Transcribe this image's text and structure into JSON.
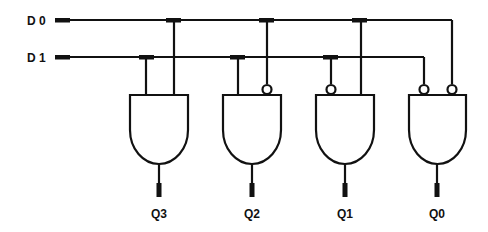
{
  "diagram": {
    "inputs": [
      {
        "label": "D 0",
        "y": 20
      },
      {
        "label": "D 1",
        "y": 57
      }
    ],
    "outputs": [
      {
        "label": "Q3",
        "x": 159
      },
      {
        "label": "Q2",
        "x": 252
      },
      {
        "label": "Q1",
        "x": 345
      },
      {
        "label": "Q0",
        "x": 437
      }
    ],
    "gates": [
      {
        "name": "and-gate-q3",
        "inputs": [
          "D1",
          "D0"
        ],
        "inverted": [
          false,
          false
        ]
      },
      {
        "name": "and-gate-q2",
        "inputs": [
          "D1",
          "D0"
        ],
        "inverted": [
          false,
          true
        ]
      },
      {
        "name": "and-gate-q1",
        "inputs": [
          "D1",
          "D0"
        ],
        "inverted": [
          true,
          false
        ]
      },
      {
        "name": "and-gate-q0",
        "inputs": [
          "D1",
          "D0"
        ],
        "inverted": [
          true,
          true
        ]
      }
    ],
    "colors": {
      "line": "#111111",
      "background": "#ffffff"
    }
  }
}
